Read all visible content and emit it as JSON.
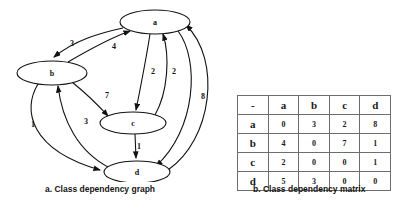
{
  "figure": {
    "graph_panel": {
      "caption": "a.  Class dependency graph",
      "nodes": [
        {
          "id": "a",
          "label": "a",
          "cx": 155,
          "cy": 22,
          "rx": 35,
          "ry": 12
        },
        {
          "id": "b",
          "label": "b",
          "cx": 52,
          "cy": 73,
          "rx": 35,
          "ry": 12
        },
        {
          "id": "c",
          "label": "c",
          "cx": 133,
          "cy": 123,
          "rx": 33,
          "ry": 11
        },
        {
          "id": "d",
          "label": "d",
          "cx": 137,
          "cy": 172,
          "rx": 33,
          "ry": 11
        }
      ],
      "edges": [
        {
          "from": "a",
          "to": "b",
          "weight": "3"
        },
        {
          "from": "b",
          "to": "a",
          "weight": "4"
        },
        {
          "from": "a",
          "to": "c",
          "weight": "2"
        },
        {
          "from": "c",
          "to": "a",
          "weight": "2"
        },
        {
          "from": "b",
          "to": "c",
          "weight": "7"
        },
        {
          "from": "b",
          "to": "d",
          "weight": "1"
        },
        {
          "from": "d",
          "to": "b",
          "weight": "3"
        },
        {
          "from": "c",
          "to": "d",
          "weight": "1"
        },
        {
          "from": "a",
          "to": "d",
          "weight": "8"
        },
        {
          "from": "d",
          "to": "a",
          "weight": "5"
        }
      ]
    },
    "matrix_panel": {
      "caption": "b. Class dependency matrix",
      "columns": [
        "-",
        "a",
        "b",
        "c",
        "d"
      ],
      "rows": [
        {
          "label": "a",
          "values": [
            "0",
            "3",
            "2",
            "8"
          ]
        },
        {
          "label": "b",
          "values": [
            "4",
            "0",
            "7",
            "1"
          ]
        },
        {
          "label": "c",
          "values": [
            "2",
            "0",
            "0",
            "1"
          ]
        },
        {
          "label": "d",
          "values": [
            "5",
            "3",
            "0",
            "0"
          ]
        }
      ]
    }
  }
}
